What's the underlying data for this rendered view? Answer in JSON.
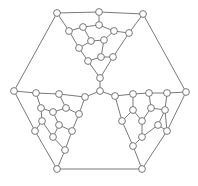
{
  "diagram": {
    "type": "graph",
    "node_radius": 3.4,
    "colors": {
      "edge": "#6a6a6a",
      "node_fill": "#ffffff",
      "node_stroke": "#6a6a6a",
      "background": "#ffffff"
    },
    "nodes": [
      {
        "id": "a0",
        "x": 57,
        "y": 13
      },
      {
        "id": "a1",
        "x": 99,
        "y": 12
      },
      {
        "id": "a2",
        "x": 143,
        "y": 14
      },
      {
        "id": "t0",
        "x": 69,
        "y": 31
      },
      {
        "id": "t1",
        "x": 83,
        "y": 27
      },
      {
        "id": "t2",
        "x": 99,
        "y": 25
      },
      {
        "id": "t3",
        "x": 114,
        "y": 31
      },
      {
        "id": "t4",
        "x": 129,
        "y": 33
      },
      {
        "id": "t5",
        "x": 91,
        "y": 41
      },
      {
        "id": "t6",
        "x": 104,
        "y": 40
      },
      {
        "id": "t7",
        "x": 79,
        "y": 48
      },
      {
        "id": "t8",
        "x": 88,
        "y": 61
      },
      {
        "id": "t9",
        "x": 101,
        "y": 57
      },
      {
        "id": "t10",
        "x": 113,
        "y": 57
      },
      {
        "id": "c0",
        "x": 100,
        "y": 78
      },
      {
        "id": "c1",
        "x": 100,
        "y": 91
      },
      {
        "id": "l0",
        "x": 14,
        "y": 91
      },
      {
        "id": "l1",
        "x": 36,
        "y": 93
      },
      {
        "id": "l2",
        "x": 59,
        "y": 94
      },
      {
        "id": "l3",
        "x": 85,
        "y": 97
      },
      {
        "id": "l4",
        "x": 41,
        "y": 108
      },
      {
        "id": "l5",
        "x": 53,
        "y": 112
      },
      {
        "id": "l6",
        "x": 66,
        "y": 108
      },
      {
        "id": "l7",
        "x": 79,
        "y": 114
      },
      {
        "id": "l8",
        "x": 42,
        "y": 121
      },
      {
        "id": "l9",
        "x": 59,
        "y": 125
      },
      {
        "id": "l10",
        "x": 35,
        "y": 131
      },
      {
        "id": "l11",
        "x": 72,
        "y": 131
      },
      {
        "id": "l12",
        "x": 53,
        "y": 137
      },
      {
        "id": "l13",
        "x": 65,
        "y": 150
      },
      {
        "id": "l14",
        "x": 57,
        "y": 169
      },
      {
        "id": "r0",
        "x": 115,
        "y": 96
      },
      {
        "id": "r1",
        "x": 133,
        "y": 94
      },
      {
        "id": "r2",
        "x": 149,
        "y": 93
      },
      {
        "id": "r3",
        "x": 167,
        "y": 93
      },
      {
        "id": "r4",
        "x": 186,
        "y": 92
      },
      {
        "id": "r5",
        "x": 133,
        "y": 110
      },
      {
        "id": "r6",
        "x": 151,
        "y": 108
      },
      {
        "id": "r7",
        "x": 165,
        "y": 110
      },
      {
        "id": "r8",
        "x": 122,
        "y": 121
      },
      {
        "id": "r9",
        "x": 142,
        "y": 121
      },
      {
        "id": "r10",
        "x": 158,
        "y": 125
      },
      {
        "id": "r11",
        "x": 167,
        "y": 131
      },
      {
        "id": "r12",
        "x": 142,
        "y": 137
      },
      {
        "id": "r13",
        "x": 133,
        "y": 146
      },
      {
        "id": "r14",
        "x": 142,
        "y": 169
      }
    ],
    "edges": [
      [
        "a0",
        "a1"
      ],
      [
        "a1",
        "a2"
      ],
      [
        "a0",
        "l0"
      ],
      [
        "a2",
        "r4"
      ],
      [
        "l14",
        "r14"
      ],
      [
        "a0",
        "t0"
      ],
      [
        "a1",
        "t2"
      ],
      [
        "a2",
        "t4"
      ],
      [
        "t0",
        "t1"
      ],
      [
        "t1",
        "t2"
      ],
      [
        "t2",
        "t3"
      ],
      [
        "t3",
        "t4"
      ],
      [
        "t0",
        "t7"
      ],
      [
        "t1",
        "t5"
      ],
      [
        "t5",
        "t6"
      ],
      [
        "t3",
        "t6"
      ],
      [
        "t5",
        "t7"
      ],
      [
        "t7",
        "t8"
      ],
      [
        "t6",
        "t9"
      ],
      [
        "t8",
        "t9"
      ],
      [
        "t9",
        "t10"
      ],
      [
        "t4",
        "t10"
      ],
      [
        "t8",
        "c0"
      ],
      [
        "t10",
        "c0"
      ],
      [
        "c0",
        "c1"
      ],
      [
        "c1",
        "l3"
      ],
      [
        "c1",
        "r0"
      ],
      [
        "l0",
        "l1"
      ],
      [
        "l1",
        "l2"
      ],
      [
        "l2",
        "l3"
      ],
      [
        "l1",
        "l4"
      ],
      [
        "l4",
        "l5"
      ],
      [
        "l5",
        "l6"
      ],
      [
        "l2",
        "l6"
      ],
      [
        "l6",
        "l7"
      ],
      [
        "l3",
        "l7"
      ],
      [
        "l4",
        "l8"
      ],
      [
        "l8",
        "l10"
      ],
      [
        "l5",
        "l9"
      ],
      [
        "l9",
        "l12"
      ],
      [
        "l8",
        "l12"
      ],
      [
        "l9",
        "l11"
      ],
      [
        "l7",
        "l11"
      ],
      [
        "l11",
        "l13"
      ],
      [
        "l12",
        "l13"
      ],
      [
        "l13",
        "l14"
      ],
      [
        "l0",
        "l10"
      ],
      [
        "l10",
        "l14"
      ],
      [
        "r0",
        "r1"
      ],
      [
        "r1",
        "r2"
      ],
      [
        "r2",
        "r3"
      ],
      [
        "r3",
        "r4"
      ],
      [
        "r1",
        "r5"
      ],
      [
        "r2",
        "r6"
      ],
      [
        "r6",
        "r7"
      ],
      [
        "r3",
        "r7"
      ],
      [
        "r0",
        "r8"
      ],
      [
        "r5",
        "r8"
      ],
      [
        "r5",
        "r9"
      ],
      [
        "r6",
        "r9"
      ],
      [
        "r7",
        "r10"
      ],
      [
        "r10",
        "r11"
      ],
      [
        "r7",
        "r11"
      ],
      [
        "r9",
        "r12"
      ],
      [
        "r10",
        "r12"
      ],
      [
        "r12",
        "r13"
      ],
      [
        "r8",
        "r13"
      ],
      [
        "r13",
        "r14"
      ],
      [
        "r11",
        "r14"
      ],
      [
        "r4",
        "r11"
      ]
    ]
  }
}
